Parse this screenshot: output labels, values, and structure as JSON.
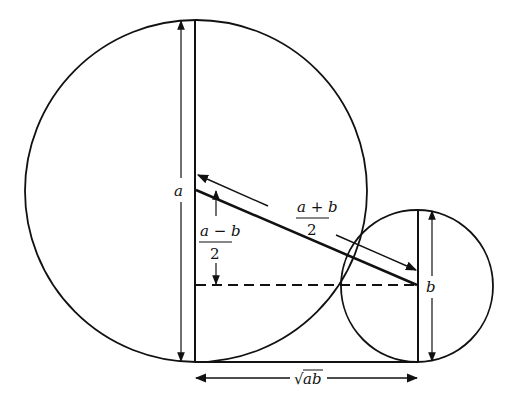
{
  "diagram": {
    "labels": {
      "diameter_large": "a",
      "diameter_small": "b",
      "hypotenuse_num": "a + b",
      "hypotenuse_den": "2",
      "difference_num": "a − b",
      "difference_den": "2",
      "base_radical": "√",
      "base_radicand": "ab"
    },
    "colors": {
      "stroke": "#111111",
      "background": "#ffffff"
    }
  }
}
